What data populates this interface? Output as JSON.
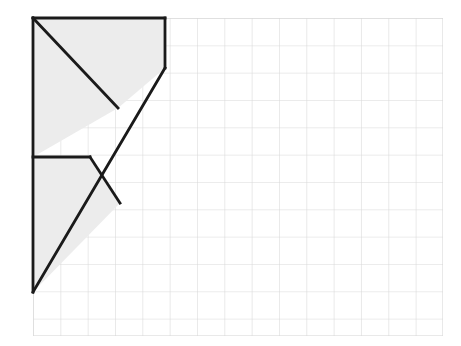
{
  "figure": {
    "kind": "grid-polygon-diagram",
    "canvas": {
      "width": 461,
      "height": 346,
      "background": "#ffffff"
    },
    "grid": {
      "label": "square-grid",
      "x_start": 33,
      "y_start": 18,
      "x_end": 443,
      "y_end": 336,
      "cell_width": 27.33,
      "cell_height": 27.33,
      "columns": 15,
      "rows": 11.64,
      "line_color": "#d8d8d8",
      "line_width": 1.1,
      "show_grid": true
    },
    "shape": {
      "label": "shaded-arrow-polygon",
      "fill_color": "#ececec",
      "stroke_color": "#1a1a1a",
      "stroke_width": 2.8,
      "vertices": [
        [
          33,
          18
        ],
        [
          165,
          18
        ],
        [
          165,
          68
        ],
        [
          33,
          292
        ],
        [
          33,
          157
        ],
        [
          90,
          157
        ],
        [
          120,
          203
        ],
        [
          33,
          157
        ]
      ],
      "outline_path": "M 33 18 L 165 18 L 165 68 L 33 292 L 33 157 L 90 157 L 120 203 L 90 157 L 33 157 Z",
      "notes": "Upper region: right triangle from top-left corner with diagonal; lower region: chevron notch pointing right."
    },
    "segments": [
      {
        "name": "top-edge",
        "from": [
          33,
          18
        ],
        "to": [
          165,
          18
        ]
      },
      {
        "name": "right-vertical-edge",
        "from": [
          165,
          18
        ],
        "to": [
          165,
          68
        ]
      },
      {
        "name": "long-diagonal-edge",
        "from": [
          165,
          68
        ],
        "to": [
          33,
          292
        ]
      },
      {
        "name": "upper-inner-diagonal",
        "from": [
          33,
          18
        ],
        "to": [
          118,
          108
        ]
      },
      {
        "name": "left-vertical-edge-upper",
        "from": [
          33,
          18
        ],
        "to": [
          33,
          157
        ]
      },
      {
        "name": "left-vertical-edge-lower",
        "from": [
          33,
          157
        ],
        "to": [
          33,
          292
        ]
      },
      {
        "name": "mid-horizontal-edge",
        "from": [
          33,
          157
        ],
        "to": [
          90,
          157
        ]
      },
      {
        "name": "chevron-upper-edge",
        "from": [
          90,
          157
        ],
        "to": [
          120,
          203
        ]
      },
      {
        "name": "chevron-lower-edge",
        "from": [
          120,
          203
        ],
        "to": [
          33,
          292
        ]
      }
    ]
  }
}
